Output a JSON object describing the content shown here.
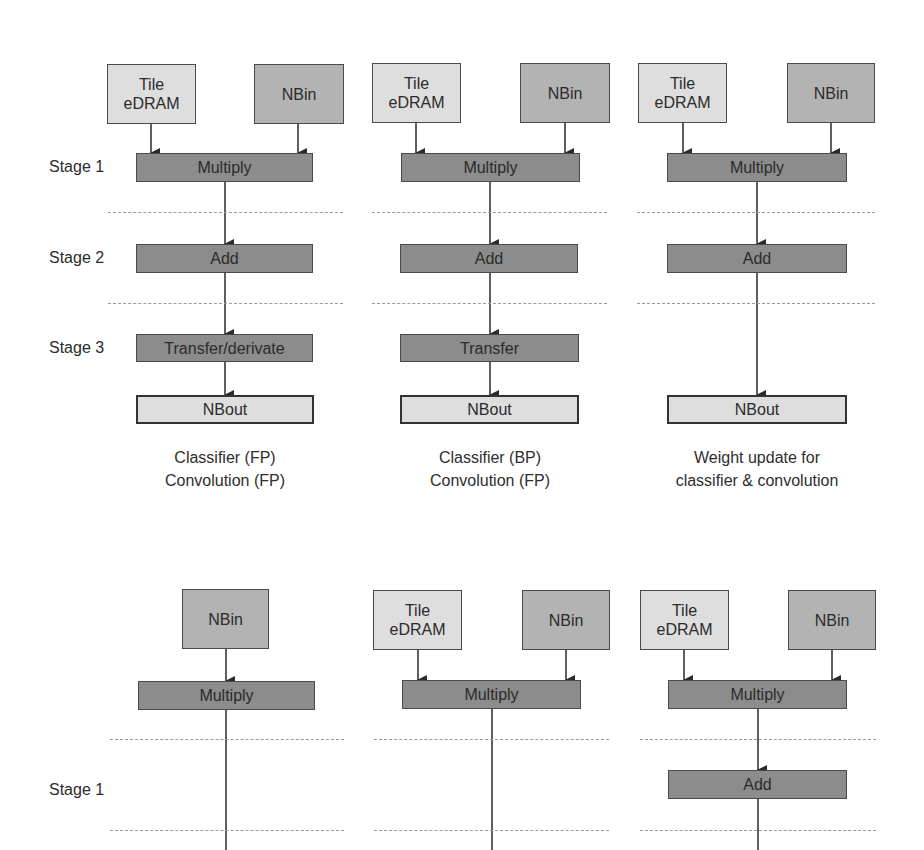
{
  "colors": {
    "light": "#dedede",
    "medium": "#b3b3b3",
    "dark": "#8c8c8c",
    "border": "#4a4a4a",
    "dash": "#9a9a9a"
  },
  "top": {
    "stage_labels": [
      "Stage 1",
      "Stage 2",
      "Stage 3"
    ],
    "panels": [
      {
        "tile_edram": "Tile\neDRAM",
        "nbin": "NBin",
        "multiply": "Multiply",
        "add": "Add",
        "transfer": "Transfer/derivate",
        "nbout": "NBout",
        "caption": [
          "Classifier (FP)",
          "Convolution (FP)"
        ]
      },
      {
        "tile_edram": "Tile\neDRAM",
        "nbin": "NBin",
        "multiply": "Multiply",
        "add": "Add",
        "transfer": "Transfer",
        "nbout": "NBout",
        "caption": [
          "Classifier (BP)",
          "Convolution (FP)"
        ]
      },
      {
        "tile_edram": "Tile\neDRAM",
        "nbin": "NBin",
        "multiply": "Multiply",
        "add": "Add",
        "nbout": "NBout",
        "caption": [
          "Weight update for",
          "classifier & convolution"
        ]
      }
    ]
  },
  "bottom": {
    "stage_labels": [
      "Stage 1"
    ],
    "panels": [
      {
        "nbin": "NBin",
        "multiply": "Multiply"
      },
      {
        "tile_edram": "Tile\neDRAM",
        "nbin": "NBin",
        "multiply": "Multiply"
      },
      {
        "tile_edram": "Tile\neDRAM",
        "nbin": "NBin",
        "multiply": "Multiply",
        "add": "Add"
      }
    ]
  }
}
